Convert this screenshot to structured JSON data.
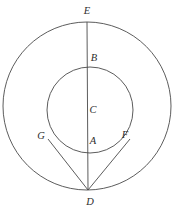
{
  "figure": {
    "background_color": "#ffffff",
    "stroke_color": "#4a4a4a",
    "label_color": "#2e2e2e",
    "canvas": {
      "width": 175,
      "height": 214
    }
  },
  "shapes": {
    "outer_circle": {
      "name": "outer-circle",
      "center_x": 87,
      "center_y": 106,
      "radius": 84
    },
    "inner_circle": {
      "name": "inner-circle",
      "center_x": 90,
      "center_y": 110,
      "radius": 43
    },
    "diameter_line": {
      "name": "vertical-diameter-ED",
      "x1": 87,
      "y1": 22,
      "x2": 88,
      "y2": 190
    },
    "tangent_left": {
      "name": "tangent-line-DG",
      "x1": 88,
      "y1": 190,
      "x2": 48,
      "y2": 139
    },
    "tangent_right": {
      "name": "tangent-line-DF",
      "x1": 88,
      "y1": 190,
      "x2": 130,
      "y2": 139
    }
  },
  "labels": [
    {
      "text": "E",
      "x": 87,
      "y": 11
    },
    {
      "text": "B",
      "x": 94,
      "y": 58
    },
    {
      "text": "C",
      "x": 93,
      "y": 110
    },
    {
      "text": "A",
      "x": 93,
      "y": 141
    },
    {
      "text": "G",
      "x": 41,
      "y": 136
    },
    {
      "text": "F",
      "x": 125,
      "y": 135
    },
    {
      "text": "D",
      "x": 90,
      "y": 202
    }
  ]
}
